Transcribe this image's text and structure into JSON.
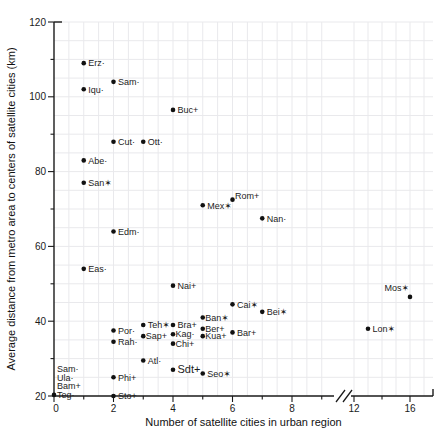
{
  "chart_data": {
    "type": "scatter",
    "title": "",
    "xlabel": "Number of satellite cities in urban region",
    "ylabel": "Average distance from metro area to centers of satellite cities (km)",
    "x_range_left_of_break": [
      0,
      9.5
    ],
    "x_range_right_of_break": [
      12,
      17
    ],
    "x_axis_break_between": [
      9.5,
      12
    ],
    "y_range": [
      20,
      120
    ],
    "x_ticks": [
      0,
      2,
      4,
      6,
      8,
      12,
      16
    ],
    "x_minor_ticks": [
      1,
      3,
      5,
      7,
      9,
      14
    ],
    "y_ticks": [
      20,
      40,
      60,
      80,
      100,
      120
    ],
    "y_minor_ticks": [
      30,
      50,
      70,
      90,
      110
    ],
    "grid": "on",
    "marker": "filled-circle",
    "points": [
      {
        "label": "Erz·",
        "x": 1,
        "y": 109
      },
      {
        "label": "Sam·",
        "x": 2,
        "y": 104
      },
      {
        "label": "Iqu·",
        "x": 1,
        "y": 102
      },
      {
        "label": "Buc+",
        "x": 4,
        "y": 96.5
      },
      {
        "label": "Cut·",
        "x": 2,
        "y": 88
      },
      {
        "label": "Ott·",
        "x": 3,
        "y": 88
      },
      {
        "label": "Abe·",
        "x": 1,
        "y": 83
      },
      {
        "label": "San✶",
        "x": 1,
        "y": 77
      },
      {
        "label": "Mex✶",
        "x": 5,
        "y": 71,
        "ly": 1
      },
      {
        "label": "Rom+",
        "x": 6,
        "y": 72.5,
        "lx": -2,
        "ly": -4
      },
      {
        "label": "Nan·",
        "x": 7,
        "y": 67.5
      },
      {
        "label": "Edm·",
        "x": 2,
        "y": 64
      },
      {
        "label": "Eas·",
        "x": 1,
        "y": 54
      },
      {
        "label": "Nai+",
        "x": 4,
        "y": 49.5
      },
      {
        "label": "Cai✶",
        "x": 6,
        "y": 44.5
      },
      {
        "label": "Bei✶",
        "x": 7,
        "y": 42.5
      },
      {
        "label": "Mos✶",
        "x": 16,
        "y": 46.5,
        "lx": -30,
        "ly": -9
      },
      {
        "label": "Lon✶",
        "x": 13,
        "y": 38
      },
      {
        "label": "Ban✶",
        "x": 5,
        "y": 41,
        "lx": -2
      },
      {
        "label": "Ber+",
        "x": 5,
        "y": 38,
        "lx": -2
      },
      {
        "label": "Kua+",
        "x": 5,
        "y": 36,
        "lx": -2
      },
      {
        "label": "Bar+",
        "x": 6,
        "y": 37
      },
      {
        "label": "Teh✶",
        "x": 3,
        "y": 39
      },
      {
        "label": "Sap+",
        "x": 3,
        "y": 36,
        "lx": -2
      },
      {
        "label": "Bra+",
        "x": 4,
        "y": 39
      },
      {
        "label": "Kag·",
        "x": 4,
        "y": 36.5,
        "lx": -2
      },
      {
        "label": "Chi+",
        "x": 4,
        "y": 34,
        "lx": -2
      },
      {
        "label": "Por·",
        "x": 2,
        "y": 37.5
      },
      {
        "label": "Rah·",
        "x": 2,
        "y": 34.5
      },
      {
        "label": "Atl·",
        "x": 3,
        "y": 29.5
      },
      {
        "label": "Phi+",
        "x": 2,
        "y": 25
      },
      {
        "label": "Sdt+",
        "x": 4,
        "y": 27,
        "big": true
      },
      {
        "label": "Seo✶",
        "x": 5,
        "y": 26
      },
      {
        "label": "Sto+",
        "x": 2,
        "y": 20
      }
    ],
    "origin_cluster": {
      "x": 0,
      "y": 20.3,
      "labels": [
        "Sam·",
        "Ula·",
        "Bam+",
        "Teg·"
      ]
    }
  },
  "colors": {
    "background": "#ffffff",
    "axis": "#1a1a1a",
    "grid": "#e9e9ec",
    "point": "#111111",
    "label_text": "#1c1c1c"
  }
}
